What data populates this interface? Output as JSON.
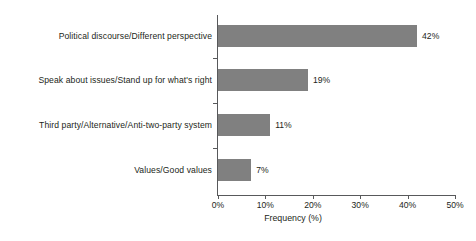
{
  "chart_data": {
    "type": "bar",
    "orientation": "horizontal",
    "title": "",
    "xlabel": "Frequency (%)",
    "ylabel": "",
    "xlim": [
      0,
      50
    ],
    "grid": false,
    "legend": null,
    "categories": [
      "Political discourse/Different perspective",
      "Speak about issues/Stand up for what's right",
      "Third party/Alternative/Anti-two-party system",
      "Values/Good values"
    ],
    "values": [
      42,
      19,
      11,
      7
    ],
    "value_labels": [
      "42%",
      "19%",
      "11%",
      "7%"
    ],
    "xticks": [
      0,
      10,
      20,
      30,
      40,
      50
    ],
    "xtick_labels": [
      "0%",
      "10%",
      "20%",
      "30%",
      "40%",
      "50%"
    ],
    "bar_color": "#808080",
    "axis_color": "#58595b",
    "text_color": "#231f20",
    "background": "#ffffff"
  }
}
